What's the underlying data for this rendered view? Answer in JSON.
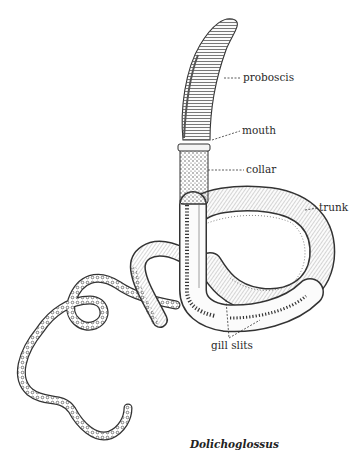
{
  "figure": {
    "caption": "Dolichoglossus",
    "labels": [
      {
        "id": "proboscis",
        "text": "proboscis"
      },
      {
        "id": "mouth",
        "text": "mouth"
      },
      {
        "id": "collar",
        "text": "collar"
      },
      {
        "id": "trunk",
        "text": "trunk"
      },
      {
        "id": "gill_slits",
        "text": "gill slits"
      }
    ],
    "colors": {
      "background": "#ffffff",
      "ink": "#2a2a2a",
      "shading": "#6a6a6a"
    }
  }
}
